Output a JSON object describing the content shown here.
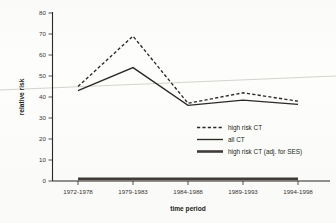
{
  "chart_data": {
    "type": "line",
    "title": "",
    "xlabel": "time period",
    "ylabel": "relative risk",
    "categories": [
      "1972-1978",
      "1979-1983",
      "1984-1988",
      "1989-1993",
      "1994-1998"
    ],
    "ylim": [
      0,
      80
    ],
    "yticks": [
      0,
      10,
      20,
      30,
      40,
      50,
      60,
      70,
      80
    ],
    "grid": false,
    "legend_position": "center-right",
    "series": [
      {
        "name": "high risk CT",
        "style": "dashed",
        "values": [
          45,
          69,
          37,
          42,
          38
        ]
      },
      {
        "name": "all CT",
        "style": "solid-thin",
        "values": [
          43,
          54,
          36,
          38.5,
          36.5
        ]
      },
      {
        "name": "high risk CT (adj. for SES)",
        "style": "solid-thick",
        "values": [
          1,
          1,
          1,
          1,
          1
        ]
      }
    ],
    "annotations": [
      "faint diagonal scan artifact line across image"
    ]
  },
  "axes": {
    "y_title": "relative risk",
    "x_title": "time period",
    "y_tick_labels": [
      "0",
      "10",
      "20",
      "30",
      "40",
      "50",
      "60",
      "70",
      "80"
    ],
    "x_tick_labels": [
      "1972-1978",
      "1979-1983",
      "1984-1988",
      "1989-1993",
      "1994-1998"
    ]
  },
  "legend": {
    "items": [
      {
        "label": "high risk CT",
        "swatch": "dashed-line-swatch"
      },
      {
        "label": "all CT",
        "swatch": "thin-line-swatch"
      },
      {
        "label": "high risk CT (adj. for SES)",
        "swatch": "thick-line-swatch"
      }
    ]
  },
  "colors": {
    "ink": "#231f20",
    "line": "#2c2826",
    "flat_series": "#403c39",
    "artifact": "#cfcdc6",
    "paper": "#fdfdfb"
  }
}
